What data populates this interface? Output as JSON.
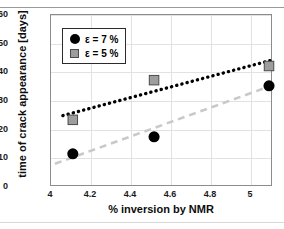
{
  "chart_data": {
    "type": "scatter",
    "title": "",
    "xlabel": "% inversion by NMR",
    "ylabel": "time of crack appearance [days]",
    "xlim": [
      4.0,
      5.11
    ],
    "ylim": [
      0,
      60
    ],
    "xticks": [
      "4",
      "4.2",
      "4.4",
      "4.6",
      "4.8",
      "5"
    ],
    "xtick_values": [
      4.0,
      4.2,
      4.4,
      4.6,
      4.8,
      5.0
    ],
    "yticks": [
      "0",
      "10",
      "20",
      "30",
      "40",
      "50",
      "60"
    ],
    "ytick_values": [
      0,
      10,
      20,
      30,
      40,
      50,
      60
    ],
    "grid": true,
    "legend_position": "upper-left-inside",
    "series": [
      {
        "name": "ε = 7 %",
        "marker": "circle",
        "color": "#000000",
        "x": [
          4.11,
          4.52,
          5.1
        ],
        "values": [
          11,
          17,
          35
        ],
        "trendline": {
          "style": "dotted",
          "color": "#000000",
          "x_start": 4.06,
          "y_start": 24.5,
          "x_end": 5.11,
          "y_end": 44.0
        }
      },
      {
        "name": "ε = 5 %",
        "marker": "square",
        "color": "#9d9d9d",
        "x": [
          4.11,
          4.52,
          5.1
        ],
        "values": [
          23,
          37,
          42
        ],
        "trendline": {
          "style": "dashed",
          "color": "#c9c9c9",
          "x_start": 4.02,
          "y_start": 7.5,
          "x_end": 5.11,
          "y_end": 35.0
        }
      }
    ],
    "legend": [
      {
        "label": "ε = 7 %",
        "marker": "circle",
        "color": "#000000"
      },
      {
        "label": "ε = 5 %",
        "marker": "square",
        "color": "#9d9d9d"
      }
    ]
  },
  "colors": {
    "series_black": "#000000",
    "series_gray": "#9d9d9d",
    "trend_gray": "#c9c9c9",
    "grid": "#e2e2e2",
    "frame": "#8c8c8c",
    "rule": "#9a9a9a"
  }
}
